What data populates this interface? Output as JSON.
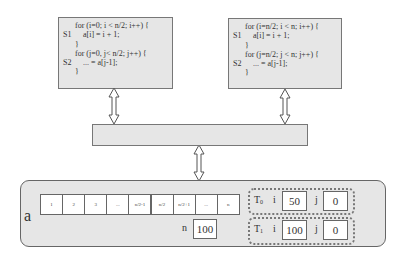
{
  "thread0_code": {
    "lines": [
      {
        "label": "",
        "indent": 1,
        "text": "for (i=0; i < n/2; i++) {"
      },
      {
        "label": "S1",
        "indent": 2,
        "text": "a[i] = i + 1;"
      },
      {
        "label": "",
        "indent": 1,
        "text": "}"
      },
      {
        "label": "",
        "indent": 1,
        "text": "for (j=0, j< n/2; j++) {"
      },
      {
        "label": "S2",
        "indent": 2,
        "text": "... = a[j-1];"
      },
      {
        "label": "",
        "indent": 1,
        "text": "}"
      }
    ]
  },
  "thread1_code": {
    "lines": [
      {
        "label": "",
        "indent": 1,
        "text": "for (i=n/2; i < n; i++) {"
      },
      {
        "label": "S1",
        "indent": 2,
        "text": "a[i] = i + 1;"
      },
      {
        "label": "",
        "indent": 1,
        "text": "}"
      },
      {
        "label": "",
        "indent": 1,
        "text": "for (j=n/2; j < n; j++) {"
      },
      {
        "label": "S2",
        "indent": 2,
        "text": "... = a[j-1];"
      },
      {
        "label": "",
        "indent": 1,
        "text": "}"
      }
    ]
  },
  "memory": {
    "array_name": "a",
    "cells": [
      "1",
      "2",
      "3",
      "...",
      "n/2-1",
      "n/2",
      "n/2+1",
      "...",
      "n"
    ],
    "n_label": "n",
    "n_value": "100",
    "threads": [
      {
        "name": "T",
        "sub": "0",
        "i_label": "i",
        "i_value": "50",
        "j_label": "j",
        "j_value": "0"
      },
      {
        "name": "T",
        "sub": "1",
        "i_label": "i",
        "i_value": "100",
        "j_label": "j",
        "j_value": "0"
      }
    ]
  },
  "colors": {
    "box_fill": "#e6e6e6",
    "border": "#777777",
    "cell_fill": "#ffffff"
  }
}
